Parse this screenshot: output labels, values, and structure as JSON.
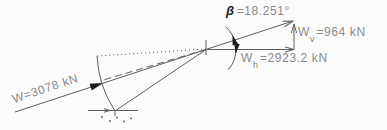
{
  "diagram_type": "force-vector-decomposition",
  "colors": {
    "line": "#5f5f5f",
    "text": "#8a8a8a",
    "emphasis": "#1c1c1c",
    "background": "#fbfbfb"
  },
  "labels": {
    "resultant": {
      "text": "W=3078 kN"
    },
    "beta": {
      "symbol": "β",
      "value": "=18.251°"
    },
    "vertical_component": {
      "base": "W",
      "sub": "v",
      "value": "=964 kN"
    },
    "horizontal_component": {
      "base": "W",
      "sub": "h",
      "value": "=2923.2 kN"
    }
  },
  "values": {
    "resultant_kN": 3078,
    "beta_deg": 18.251,
    "vertical_kN": 964,
    "horizontal_kN": 2923.2
  }
}
